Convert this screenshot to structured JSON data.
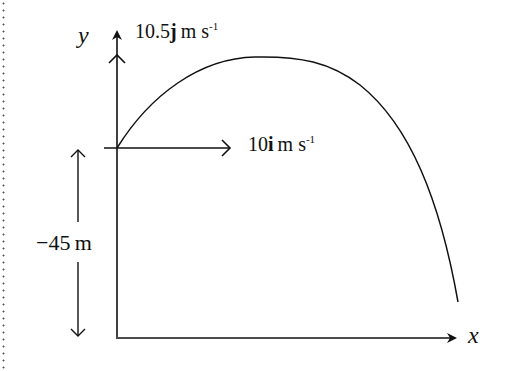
{
  "diagram": {
    "type": "projectile-motion",
    "axes": {
      "x_label": "x",
      "y_label": "y"
    },
    "vertical_velocity": {
      "value": "10.5",
      "unit_vector": "j",
      "unit": "m s",
      "exponent": "-1"
    },
    "horizontal_velocity": {
      "value": "10",
      "unit_vector": "i",
      "unit": "m s",
      "exponent": "-1"
    },
    "height_label": "−45 m",
    "colors": {
      "stroke": "#111111",
      "background": "#ffffff"
    }
  }
}
